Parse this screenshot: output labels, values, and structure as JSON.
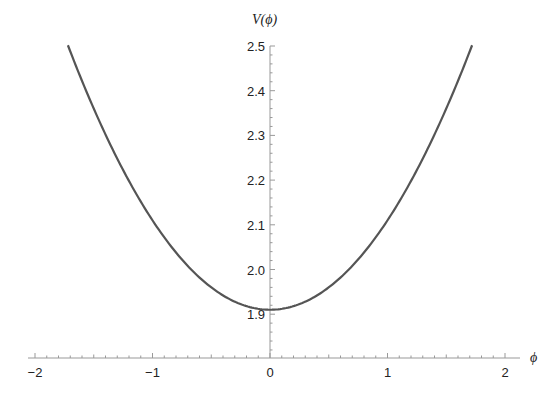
{
  "chart_data": {
    "type": "line",
    "title": "",
    "xlabel": "ϕ",
    "ylabel": "V(ϕ)",
    "xlim": [
      -2.05,
      2.05
    ],
    "ylim": [
      1.81,
      2.5
    ],
    "x_ticks": [
      -2,
      -1,
      0,
      1,
      2
    ],
    "x_tick_labels": [
      "−2",
      "−1",
      "0",
      "1",
      "2"
    ],
    "y_ticks": [
      1.9,
      2.0,
      2.1,
      2.2,
      2.3,
      2.4,
      2.5
    ],
    "y_tick_labels": [
      "1.9",
      "2.0",
      "2.1",
      "2.2",
      "2.3",
      "2.4",
      "2.5"
    ],
    "grid": false,
    "legend": null,
    "series": [
      {
        "name": "V(ϕ)",
        "color": "#555555",
        "x": [
          -1.72,
          -1.5,
          -1.25,
          -1.0,
          -0.75,
          -0.5,
          -0.25,
          0.0,
          0.25,
          0.5,
          0.75,
          1.0,
          1.25,
          1.5,
          1.72
        ],
        "values": [
          2.5,
          2.36,
          2.22,
          2.11,
          2.02,
          1.96,
          1.92,
          1.91,
          1.92,
          1.96,
          2.02,
          2.11,
          2.22,
          2.36,
          2.5
        ]
      }
    ],
    "annotations": []
  },
  "axes": {
    "x_label": "ϕ",
    "y_label": "V(ϕ)"
  },
  "colors": {
    "curve": "#555555",
    "axis": "#999999",
    "text": "#222222"
  }
}
